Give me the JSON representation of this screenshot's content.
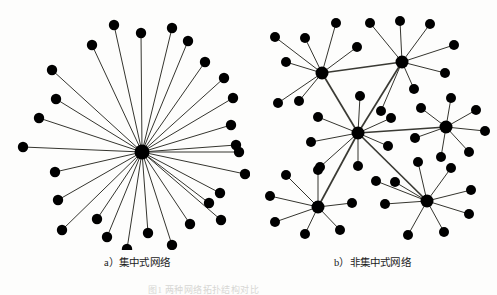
{
  "figure": {
    "title_partial": "图1  两种网络拓扑结构对比",
    "panels": [
      {
        "id": "a",
        "caption": "a）集中式网络",
        "type": "centralized",
        "hub_count": 1,
        "leaf_count": 28
      },
      {
        "id": "b",
        "caption": "b）非集中式网络",
        "type": "decentralized",
        "hub_count": 6,
        "leaf_count": 48
      }
    ]
  },
  "colors": {
    "node": "#000000",
    "edge": "#35352f",
    "background": "#fdfdfc",
    "caption_text": "#1a1a1a"
  },
  "graph_a": {
    "hub": {
      "x": 142,
      "y": 152,
      "r": 7.5
    },
    "leaf_radius": 5.2,
    "leaves": [
      {
        "x": 114,
        "y": 25
      },
      {
        "x": 141,
        "y": 33
      },
      {
        "x": 172,
        "y": 28
      },
      {
        "x": 92,
        "y": 45
      },
      {
        "x": 188,
        "y": 41
      },
      {
        "x": 205,
        "y": 62
      },
      {
        "x": 52,
        "y": 70
      },
      {
        "x": 224,
        "y": 78
      },
      {
        "x": 56,
        "y": 99
      },
      {
        "x": 233,
        "y": 98
      },
      {
        "x": 39,
        "y": 118
      },
      {
        "x": 231,
        "y": 125
      },
      {
        "x": 23,
        "y": 147
      },
      {
        "x": 236,
        "y": 145
      },
      {
        "x": 239,
        "y": 152
      },
      {
        "x": 55,
        "y": 172
      },
      {
        "x": 245,
        "y": 174
      },
      {
        "x": 58,
        "y": 200
      },
      {
        "x": 220,
        "y": 193
      },
      {
        "x": 62,
        "y": 230
      },
      {
        "x": 221,
        "y": 220
      },
      {
        "x": 97,
        "y": 219
      },
      {
        "x": 190,
        "y": 224
      },
      {
        "x": 107,
        "y": 237
      },
      {
        "x": 172,
        "y": 245
      },
      {
        "x": 127,
        "y": 249
      },
      {
        "x": 148,
        "y": 233
      },
      {
        "x": 209,
        "y": 203
      }
    ]
  },
  "graph_b": {
    "hub_radius": 6.5,
    "leaf_radius": 5.0,
    "hubs": [
      {
        "id": "h1",
        "x": 74,
        "y": 73
      },
      {
        "id": "h2",
        "x": 154,
        "y": 62
      },
      {
        "id": "h3",
        "x": 110,
        "y": 133
      },
      {
        "id": "h4",
        "x": 198,
        "y": 127
      },
      {
        "id": "h5",
        "x": 70,
        "y": 207
      },
      {
        "id": "h6",
        "x": 179,
        "y": 201
      }
    ],
    "hub_links": [
      {
        "from": "h1",
        "to": "h2"
      },
      {
        "from": "h1",
        "to": "h3"
      },
      {
        "from": "h2",
        "to": "h3"
      },
      {
        "from": "h3",
        "to": "h4"
      },
      {
        "from": "h3",
        "to": "h5"
      },
      {
        "from": "h3",
        "to": "h6"
      }
    ],
    "leaves": [
      {
        "hub": "h1",
        "x": 27,
        "y": 37
      },
      {
        "hub": "h1",
        "x": 57,
        "y": 38
      },
      {
        "hub": "h1",
        "x": 88,
        "y": 23
      },
      {
        "hub": "h1",
        "x": 109,
        "y": 47
      },
      {
        "hub": "h1",
        "x": 38,
        "y": 62
      },
      {
        "hub": "h1",
        "x": 51,
        "y": 101
      },
      {
        "hub": "h1",
        "x": 30,
        "y": 103
      },
      {
        "hub": "h2",
        "x": 122,
        "y": 23
      },
      {
        "hub": "h2",
        "x": 152,
        "y": 21
      },
      {
        "hub": "h2",
        "x": 182,
        "y": 24
      },
      {
        "hub": "h2",
        "x": 206,
        "y": 45
      },
      {
        "hub": "h2",
        "x": 197,
        "y": 73
      },
      {
        "hub": "h2",
        "x": 166,
        "y": 89
      },
      {
        "hub": "h2",
        "x": 133,
        "y": 111
      },
      {
        "hub": "h3",
        "x": 112,
        "y": 96
      },
      {
        "hub": "h3",
        "x": 70,
        "y": 117
      },
      {
        "hub": "h3",
        "x": 63,
        "y": 142
      },
      {
        "hub": "h3",
        "x": 72,
        "y": 167
      },
      {
        "hub": "h3",
        "x": 110,
        "y": 166
      },
      {
        "hub": "h3",
        "x": 140,
        "y": 146
      },
      {
        "hub": "h3",
        "x": 143,
        "y": 118
      },
      {
        "hub": "h4",
        "x": 173,
        "y": 108
      },
      {
        "hub": "h4",
        "x": 203,
        "y": 98
      },
      {
        "hub": "h4",
        "x": 228,
        "y": 110
      },
      {
        "hub": "h4",
        "x": 237,
        "y": 131
      },
      {
        "hub": "h4",
        "x": 221,
        "y": 152
      },
      {
        "hub": "h4",
        "x": 193,
        "y": 157
      },
      {
        "hub": "h4",
        "x": 167,
        "y": 138
      },
      {
        "hub": "h5",
        "x": 22,
        "y": 196
      },
      {
        "hub": "h5",
        "x": 38,
        "y": 175
      },
      {
        "hub": "h5",
        "x": 70,
        "y": 170
      },
      {
        "hub": "h5",
        "x": 104,
        "y": 203
      },
      {
        "hub": "h5",
        "x": 92,
        "y": 230
      },
      {
        "hub": "h5",
        "x": 57,
        "y": 234
      },
      {
        "hub": "h5",
        "x": 27,
        "y": 222
      },
      {
        "hub": "h6",
        "x": 147,
        "y": 182
      },
      {
        "hub": "h6",
        "x": 170,
        "y": 162
      },
      {
        "hub": "h6",
        "x": 203,
        "y": 168
      },
      {
        "hub": "h6",
        "x": 223,
        "y": 190
      },
      {
        "hub": "h6",
        "x": 221,
        "y": 214
      },
      {
        "hub": "h6",
        "x": 196,
        "y": 232
      },
      {
        "hub": "h6",
        "x": 160,
        "y": 235
      },
      {
        "hub": "h6",
        "x": 137,
        "y": 204
      },
      {
        "hub": "h6",
        "x": 128,
        "y": 181
      }
    ]
  }
}
